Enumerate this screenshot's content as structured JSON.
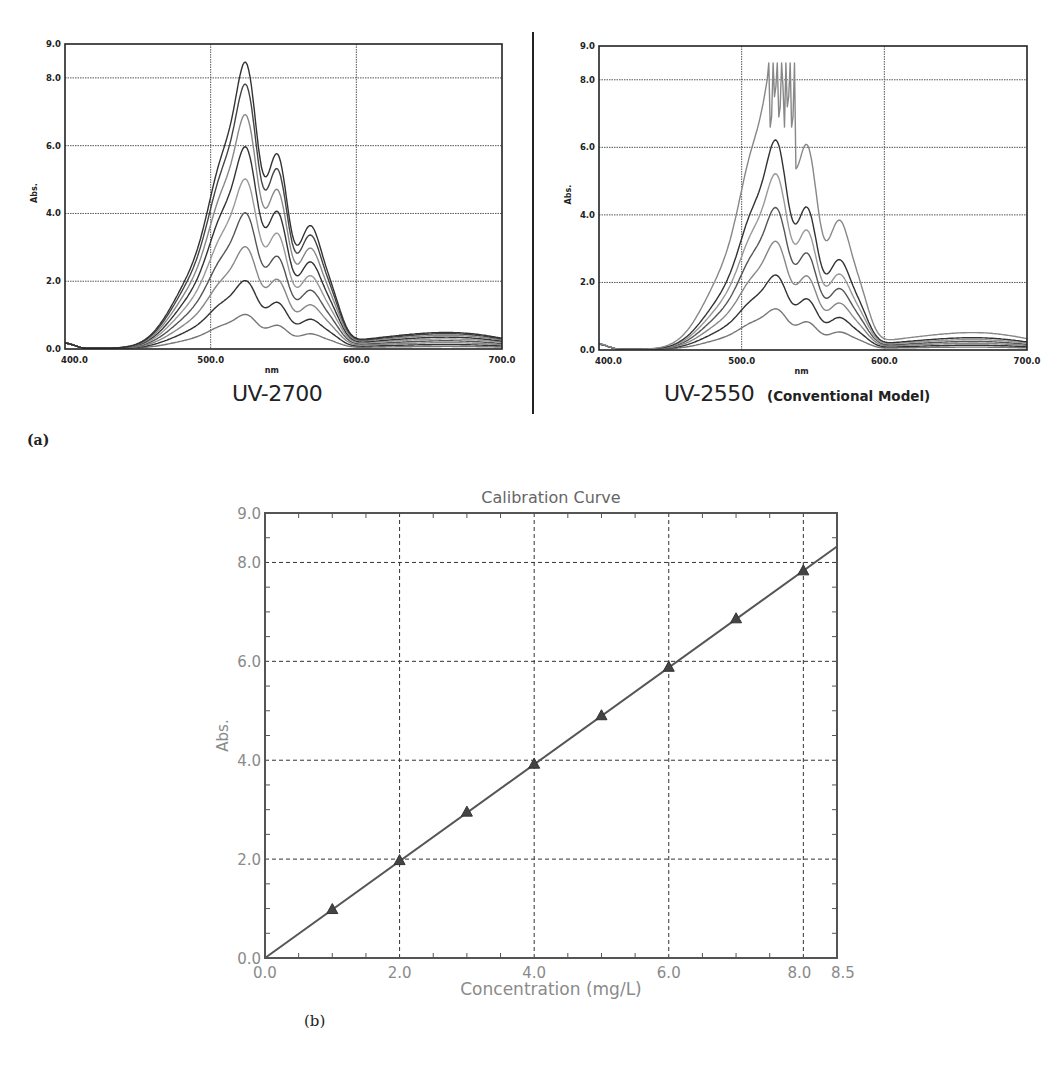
{
  "figure": {
    "panel_a_label": "(a)",
    "panel_b_label": "(b)"
  },
  "spectra": {
    "left": {
      "model": "UV-2700",
      "subtitle": "",
      "ylabel": "Abs.",
      "xlabel": "nm",
      "xticks": [
        "400.0",
        "500.0",
        "600.0",
        "700.0"
      ],
      "yticks": [
        "0.0",
        "2.0",
        "4.0",
        "6.0",
        "8.0",
        "9.0"
      ]
    },
    "right": {
      "model": "UV-2550",
      "subtitle": "(Conventional Model)",
      "ylabel": "Abs.",
      "xlabel": "nm",
      "xticks": [
        "400.0",
        "500.0",
        "600.0",
        "700.0"
      ],
      "yticks": [
        "0.0",
        "2.0",
        "4.0",
        "6.0",
        "8.0",
        "9.0"
      ]
    }
  },
  "calibration": {
    "title": "Calibration Curve",
    "xlabel": "Concentration (mg/L)",
    "ylabel": "Abs.",
    "xticks": [
      "0.0",
      "2.0",
      "4.0",
      "6.0",
      "8.0",
      "8.5"
    ],
    "yticks": [
      "0.0",
      "2.0",
      "4.0",
      "6.0",
      "8.0",
      "9.0"
    ]
  },
  "chart_data": [
    {
      "type": "line",
      "title": "UV-2700",
      "xlabel": "nm",
      "ylabel": "Abs.",
      "xlim": [
        400,
        700
      ],
      "ylim": [
        0,
        9
      ],
      "grid": true,
      "xticks": [
        400,
        500,
        600,
        700
      ],
      "yticks": [
        0,
        2,
        4,
        6,
        8,
        9
      ],
      "description": "Absorption spectra of 8 concentrations; twin peaks near 526 nm and 546 nm with shoulders near 512 nm and 568 nm",
      "peak_wavelengths_nm": [
        526,
        546
      ],
      "series": [
        {
          "name": "std1",
          "peak_abs": 1.0
        },
        {
          "name": "std2",
          "peak_abs": 2.0
        },
        {
          "name": "std3",
          "peak_abs": 3.0
        },
        {
          "name": "std4",
          "peak_abs": 4.0
        },
        {
          "name": "std5",
          "peak_abs": 5.0
        },
        {
          "name": "std6",
          "peak_abs": 5.95
        },
        {
          "name": "std7",
          "peak_abs": 6.9
        },
        {
          "name": "std8",
          "peak_abs": 7.8
        },
        {
          "name": "std9",
          "peak_abs": 8.45
        }
      ]
    },
    {
      "type": "line",
      "title": "UV-2550 (Conventional Model)",
      "xlabel": "nm",
      "ylabel": "Abs.",
      "xlim": [
        400,
        700
      ],
      "ylim": [
        0,
        9
      ],
      "grid": true,
      "xticks": [
        400,
        500,
        600,
        700
      ],
      "yticks": [
        0,
        2,
        4,
        6,
        8,
        9
      ],
      "description": "Absorption spectra of same samples; highest concentration saturates/noisy above ~8.5 Abs between ~519 and 537 nm",
      "peak_wavelengths_nm": [
        526,
        546
      ],
      "saturation_abs": 8.5,
      "saturation_range_nm": [
        519,
        537
      ],
      "series": [
        {
          "name": "std1",
          "peak_abs": 1.2
        },
        {
          "name": "std2",
          "peak_abs": 2.2
        },
        {
          "name": "std3",
          "peak_abs": 3.2
        },
        {
          "name": "std4",
          "peak_abs": 4.2
        },
        {
          "name": "std5",
          "peak_abs": 5.2
        },
        {
          "name": "std6",
          "peak_abs": 6.2
        },
        {
          "name": "std7",
          "peak_abs": 8.5,
          "saturated": true
        }
      ]
    },
    {
      "type": "scatter",
      "title": "Calibration Curve",
      "xlabel": "Concentration (mg/L)",
      "ylabel": "Abs.",
      "xlim": [
        0,
        8.5
      ],
      "ylim": [
        0,
        9
      ],
      "grid": true,
      "grid_style": "dashed",
      "xticks": [
        0.0,
        2.0,
        4.0,
        6.0,
        8.0,
        8.5
      ],
      "yticks": [
        0.0,
        2.0,
        4.0,
        6.0,
        8.0,
        9.0
      ],
      "marker": "triangle",
      "x": [
        1,
        2,
        3,
        4,
        5,
        6,
        7,
        8
      ],
      "y": [
        0.98,
        1.97,
        2.95,
        3.92,
        4.9,
        5.88,
        6.86,
        7.83
      ],
      "fit_line": {
        "type": "linear",
        "slope": 0.979,
        "intercept": 0.0,
        "x_range": [
          0,
          8.5
        ]
      }
    }
  ]
}
